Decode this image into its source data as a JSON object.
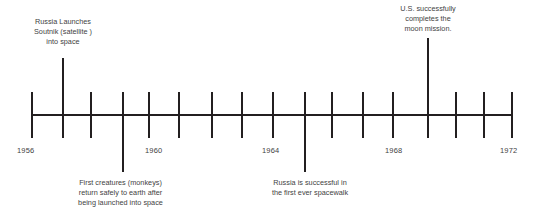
{
  "figure": {
    "kind": "timeline",
    "title": "",
    "background_color": "#ffffff",
    "line_color": "#231f20",
    "text_color": "#3f3f3f"
  },
  "axis": {
    "orientation": "horizontal",
    "start_year": 1956,
    "end_year": 1972,
    "tick_interval_years": 1,
    "labeled_interval_years": 4,
    "ticks": [
      {
        "year": 1956,
        "x": 31,
        "label": "1956",
        "labeled": true
      },
      {
        "year": 1957,
        "x": 62,
        "label": "",
        "labeled": false
      },
      {
        "year": 1958,
        "x": 90,
        "label": "",
        "labeled": false
      },
      {
        "year": 1959,
        "x": 122,
        "label": "",
        "labeled": false
      },
      {
        "year": 1960,
        "x": 148,
        "label": "1960",
        "labeled": true
      },
      {
        "year": 1961,
        "x": 178,
        "label": "",
        "labeled": false
      },
      {
        "year": 1962,
        "x": 211,
        "label": "",
        "labeled": false
      },
      {
        "year": 1963,
        "x": 241,
        "label": "",
        "labeled": false
      },
      {
        "year": 1964,
        "x": 272,
        "label": "1964",
        "labeled": true
      },
      {
        "year": 1965,
        "x": 304,
        "label": "",
        "labeled": false
      },
      {
        "year": 1966,
        "x": 331,
        "label": "",
        "labeled": false
      },
      {
        "year": 1967,
        "x": 362,
        "label": "",
        "labeled": false
      },
      {
        "year": 1968,
        "x": 392,
        "label": "1968",
        "labeled": true
      },
      {
        "year": 1969,
        "x": 427,
        "label": "",
        "labeled": false
      },
      {
        "year": 1970,
        "x": 455,
        "label": "",
        "labeled": false
      },
      {
        "year": 1971,
        "x": 483,
        "label": "",
        "labeled": false
      },
      {
        "year": 1972,
        "x": 511,
        "label": "1972",
        "labeled": true
      }
    ],
    "year_labels": [
      "1956",
      "1960",
      "1964",
      "1968",
      "1972"
    ]
  },
  "events": [
    {
      "id": "sputnik",
      "year": 1957,
      "text": "Russia Launches\nSoutnik (satellite )\ninto space",
      "lines": [
        "Russia Launches",
        "Soutnik (satellite )",
        "into space"
      ],
      "side": "above",
      "stem_x": 62
    },
    {
      "id": "monkeys",
      "year": 1959,
      "text": "First creatures (monkeys)\nreturn safely to earth after\nbeing launched into space",
      "lines": [
        "First creatures (monkeys)",
        "return safely to earth after",
        "being launched into space"
      ],
      "side": "below",
      "stem_x": 122
    },
    {
      "id": "spacewalk",
      "year": 1965,
      "text": "Russia is successful in\nthe first ever spacewalk",
      "lines": [
        "Russia is successful in",
        "the first ever spacewalk"
      ],
      "side": "below",
      "stem_x": 304
    },
    {
      "id": "moon-mission",
      "year": 1969,
      "text": "U.S. successfully\ncompletes the\nmoon mission.",
      "lines": [
        "U.S. successfully",
        "completes the",
        "moon mission."
      ],
      "side": "above",
      "stem_x": 427
    }
  ]
}
